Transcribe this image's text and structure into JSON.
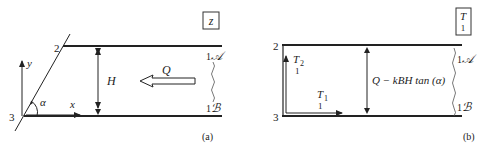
{
  "panels": [
    {
      "id": "a",
      "caption": "(a)",
      "box_label": "z",
      "corner_top": "2",
      "corner_bottom": "3",
      "right_top": "1",
      "right_top_sym": "𝒜",
      "right_bottom": "1",
      "right_bottom_sym": "ℬ",
      "axis_y": "y",
      "axis_x": "x",
      "angle": "α",
      "height_label": "H",
      "flow_label": "Q"
    },
    {
      "id": "b",
      "caption": "(b)",
      "box_label_top": "T",
      "box_label_bottom": "1",
      "corner_top": "2",
      "corner_bottom": "3",
      "right_top": "1",
      "right_top_sym": "𝒜",
      "right_bottom": "1",
      "right_bottom_sym": "ℬ",
      "t2_label": "T",
      "t2_sub": "2",
      "t2_under": "1",
      "t1_label": "T",
      "t1_sub": "1",
      "t1_under": "1",
      "formula": "Q − kBH tan (α)"
    }
  ]
}
